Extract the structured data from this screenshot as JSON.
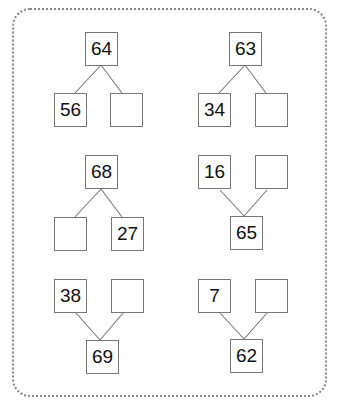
{
  "puzzles": [
    {
      "orientation": "whole-top",
      "whole": "64",
      "part_left": "56",
      "part_right": ""
    },
    {
      "orientation": "whole-top",
      "whole": "63",
      "part_left": "34",
      "part_right": ""
    },
    {
      "orientation": "whole-top",
      "whole": "68",
      "part_left": "",
      "part_right": "27"
    },
    {
      "orientation": "whole-bottom",
      "whole": "65",
      "part_left": "16",
      "part_right": ""
    },
    {
      "orientation": "whole-bottom",
      "whole": "69",
      "part_left": "38",
      "part_right": ""
    },
    {
      "orientation": "whole-bottom",
      "whole": "62",
      "part_left": "7",
      "part_right": ""
    }
  ],
  "colors": {
    "border": "#777777",
    "frame": "#888888",
    "text": "#111111"
  }
}
